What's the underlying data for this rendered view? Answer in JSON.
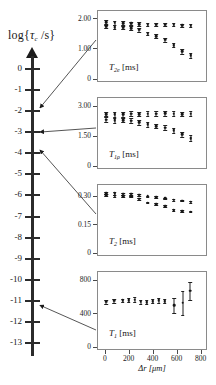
{
  "figure": {
    "log_axis": {
      "title_prefix": "log{",
      "title_symbol": "τ",
      "title_subscript": "c",
      "title_suffix": " /s}",
      "ticks": [
        0,
        -1,
        -2,
        -3,
        -4,
        -5,
        -6,
        -7,
        -8,
        -9,
        -10,
        -11,
        -12,
        -13
      ],
      "tick_labels": [
        "0",
        "-1",
        "-2",
        "-3",
        "-4",
        "-5",
        "-6",
        "-7",
        "-8",
        "-9",
        "-10",
        "-11",
        "-12",
        "-13"
      ],
      "axis_min": -13.6,
      "axis_max": 0.6,
      "arrow_head": "up"
    },
    "annotations": [
      {
        "name": "arrow-t2e",
        "from_log_value": -1.85,
        "to_panel": "T_2e"
      },
      {
        "name": "arrow-t1rho",
        "from_log_value": -3.0,
        "to_panel": "T_1rho"
      },
      {
        "name": "arrow-t2",
        "from_log_value": -3.85,
        "to_panel": "T_2"
      },
      {
        "name": "arrow-t1",
        "from_log_value": -11.2,
        "to_panel": "T_1"
      }
    ]
  },
  "chart_data": [
    {
      "type": "scatter",
      "name": "T2e-panel",
      "title": "",
      "label_symbol": "T",
      "label_subscript": "2e",
      "label_unit": "[ms]",
      "xlabel": "",
      "ylabel": "T2e [ms]",
      "xlim": [
        -40,
        800
      ],
      "ylim": [
        0,
        2.15
      ],
      "xticks": [],
      "xtick_labels": [],
      "yticks": [
        0,
        1.0,
        2.0
      ],
      "ytick_labels": [
        "0",
        "1.00",
        "2.00"
      ],
      "grid": false,
      "series": [
        {
          "name": "upper",
          "x": [
            10,
            80,
            150,
            215,
            280,
            350,
            420,
            490,
            560,
            630,
            700
          ],
          "values": [
            1.88,
            1.86,
            1.85,
            1.84,
            1.82,
            1.8,
            1.8,
            1.79,
            1.79,
            1.77,
            1.76
          ],
          "errors": [
            0.07,
            0.07,
            0.07,
            0.06,
            0.06,
            0.05,
            0.05,
            0.05,
            0.05,
            0.05,
            0.05
          ]
        },
        {
          "name": "lower",
          "x": [
            10,
            80,
            150,
            215,
            280,
            350,
            420,
            490,
            560,
            630,
            700
          ],
          "values": [
            1.74,
            1.72,
            1.7,
            1.68,
            1.63,
            1.5,
            1.42,
            1.3,
            1.12,
            0.92,
            0.78
          ],
          "errors": [
            0.06,
            0.06,
            0.06,
            0.06,
            0.06,
            0.06,
            0.06,
            0.06,
            0.07,
            0.08,
            0.09
          ]
        }
      ]
    },
    {
      "type": "scatter",
      "name": "T1rho-panel",
      "title": "",
      "label_symbol": "T",
      "label_subscript": "1ρ",
      "label_unit": "[ms]",
      "xlabel": "",
      "ylabel": "T1rho [ms]",
      "xlim": [
        -40,
        800
      ],
      "ylim": [
        0,
        3.25
      ],
      "xticks": [],
      "xtick_labels": [],
      "yticks": [
        0,
        1.5,
        3.0
      ],
      "ytick_labels": [
        "0",
        "1.50",
        "3.00"
      ],
      "grid": false,
      "series": [
        {
          "name": "upper",
          "x": [
            10,
            80,
            150,
            215,
            280,
            350,
            420,
            490,
            560,
            630,
            700
          ],
          "values": [
            2.6,
            2.58,
            2.58,
            2.62,
            2.6,
            2.62,
            2.62,
            2.64,
            2.62,
            2.6,
            2.62
          ],
          "errors": [
            0.12,
            0.12,
            0.12,
            0.14,
            0.12,
            0.12,
            0.12,
            0.13,
            0.12,
            0.12,
            0.13
          ]
        },
        {
          "name": "lower",
          "x": [
            10,
            80,
            150,
            215,
            280,
            350,
            420,
            490,
            560,
            630,
            700
          ],
          "values": [
            2.32,
            2.28,
            2.3,
            2.26,
            2.18,
            2.08,
            2.0,
            1.92,
            1.78,
            1.58,
            1.4
          ],
          "errors": [
            0.12,
            0.12,
            0.12,
            0.12,
            0.11,
            0.11,
            0.11,
            0.11,
            0.12,
            0.13,
            0.16
          ]
        }
      ]
    },
    {
      "type": "scatter",
      "name": "T2-panel",
      "title": "",
      "label_symbol": "T",
      "label_subscript": "2",
      "label_unit": "[ms]",
      "xlabel": "",
      "ylabel": "T2 [ms]",
      "xlim": [
        -40,
        800
      ],
      "ylim": [
        0,
        0.345
      ],
      "xticks": [],
      "xtick_labels": [],
      "yticks": [
        0,
        0.15,
        0.3
      ],
      "ytick_labels": [
        "0",
        "0.15",
        "0.30"
      ],
      "grid": false,
      "series": [
        {
          "name": "upper",
          "x": [
            10,
            80,
            150,
            215,
            280,
            350,
            420,
            490,
            560,
            630,
            700
          ],
          "values": [
            0.318,
            0.316,
            0.314,
            0.314,
            0.31,
            0.3,
            0.296,
            0.29,
            0.282,
            0.278,
            0.272
          ],
          "errors": [
            0.006,
            0.006,
            0.006,
            0.006,
            0.005,
            0.004,
            0.004,
            0.004,
            0.004,
            0.004,
            0.004
          ]
        },
        {
          "name": "lower",
          "x": [
            10,
            80,
            150,
            215,
            280,
            350,
            420,
            490,
            560,
            630,
            700
          ],
          "values": [
            0.306,
            0.304,
            0.302,
            0.3,
            0.288,
            0.268,
            0.258,
            0.248,
            0.228,
            0.222,
            0.22
          ],
          "errors": [
            0.005,
            0.005,
            0.005,
            0.005,
            0.005,
            0.005,
            0.005,
            0.005,
            0.005,
            0.005,
            0.005
          ]
        }
      ]
    },
    {
      "type": "scatter",
      "name": "T1-panel",
      "title": "",
      "label_symbol": "T",
      "label_subscript": "1",
      "label_unit": "[ms]",
      "xlabel": "Δr [μm]",
      "ylabel": "T1 [ms]",
      "xlim": [
        -40,
        820
      ],
      "ylim": [
        0,
        860
      ],
      "xticks": [
        0,
        200,
        400,
        600,
        800
      ],
      "xtick_labels": [
        "0",
        "200",
        "400",
        "600",
        "800"
      ],
      "yticks": [
        0,
        400,
        800
      ],
      "ytick_labels": [
        "0",
        "400",
        "800"
      ],
      "grid": false,
      "series": [
        {
          "name": "main",
          "x": [
            10,
            80,
            150,
            200,
            250,
            300,
            350,
            400,
            450,
            500,
            580,
            650,
            715
          ],
          "values": [
            540,
            552,
            556,
            560,
            566,
            540,
            534,
            548,
            556,
            548,
            500,
            528,
            672
          ],
          "errors": [
            22,
            24,
            22,
            24,
            26,
            22,
            22,
            24,
            26,
            26,
            90,
            140,
            108
          ]
        }
      ]
    }
  ]
}
